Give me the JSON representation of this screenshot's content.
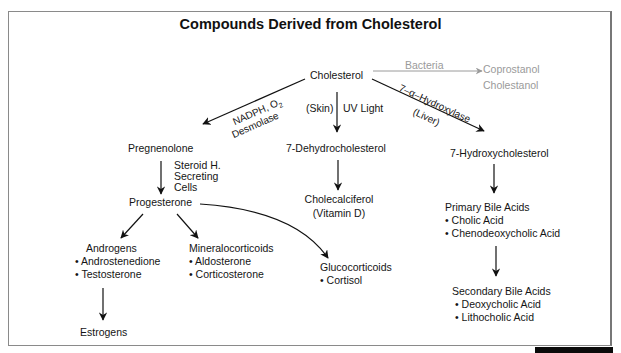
{
  "title": "Compounds Derived from Cholesterol",
  "nodes": {
    "cholesterol": "Cholesterol",
    "coprostanol": "Coprostanol",
    "cholestanol": "Cholestanol",
    "pregnenolone": "Pregnenolone",
    "dehydrocholesterol": "7-Dehydrocholesterol",
    "hydroxycholesterol": "7-Hydroxycholesterol",
    "progesterone": "Progesterone",
    "cholecalciferol": "Cholecalciferol",
    "vitamin_d": "(Vitamin D)",
    "androgens": {
      "heading": "Androgens",
      "items": [
        "• Androstenedione",
        "• Testosterone"
      ]
    },
    "mineralocorticoids": {
      "heading": "Mineralocorticoids",
      "items": [
        "• Aldosterone",
        "• Corticosterone"
      ]
    },
    "glucocorticoids": {
      "heading": "Glucocorticoids",
      "items": [
        "• Cortisol"
      ]
    },
    "estrogens": "Estrogens",
    "primary_bile_acids": {
      "heading": "Primary Bile Acids",
      "items": [
        "• Cholic Acid",
        "• Chenodeoxycholic Acid"
      ]
    },
    "secondary_bile_acids": {
      "heading": "Secondary Bile Acids",
      "items": [
        "• Deoxycholic Acid",
        "• Lithocholic Acid"
      ]
    }
  },
  "edge_labels": {
    "bacteria": "Bacteria",
    "nadph_o2": "NADPH, O",
    "nadph_sub": "2",
    "desmolase": "Desmolase",
    "skin": "(Skin)",
    "uv_light": "UV Light",
    "hydroxylase": "7–α–Hydroxylase",
    "liver": "(Liver)",
    "steroid_h": "Steroid H.",
    "secreting": "Secreting",
    "cells": "Cells"
  },
  "colors": {
    "line": "#111111",
    "muted": "#9a9a9a",
    "frame": "#8a8a8a"
  }
}
